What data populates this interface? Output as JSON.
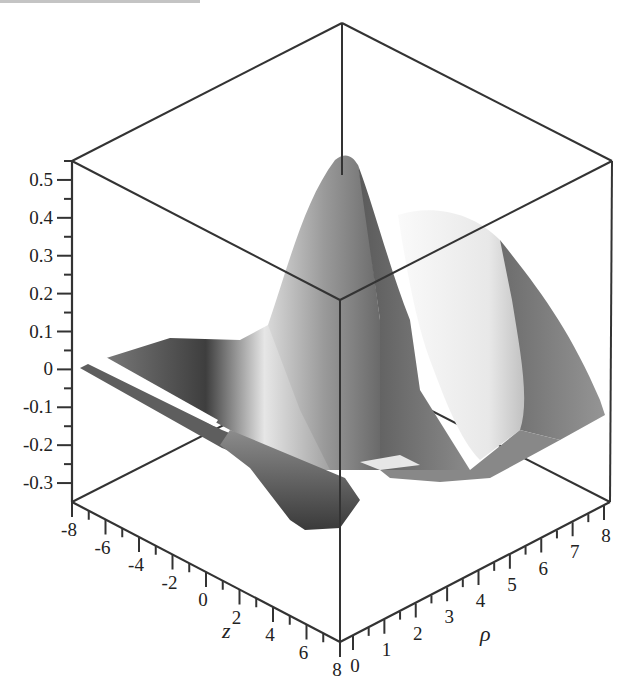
{
  "header": {
    "cropped_text": ""
  },
  "chart_data": {
    "type": "surface3d",
    "title": "",
    "xlabel": "z",
    "ylabel": "ρ",
    "zlabel": "",
    "x_range": [
      -8,
      8
    ],
    "y_range": [
      0,
      8
    ],
    "z_range": [
      -0.35,
      0.55
    ],
    "x_ticks": [
      -8,
      -6,
      -4,
      -2,
      0,
      2,
      4,
      6,
      8
    ],
    "x_tick_labels": [
      "-8",
      "-6",
      "-4",
      "-2",
      "0",
      "2",
      "4",
      "6",
      "8"
    ],
    "y_ticks": [
      0,
      1,
      2,
      3,
      4,
      5,
      6,
      7,
      8
    ],
    "y_tick_labels": [
      "0",
      "1",
      "2",
      "3",
      "4",
      "5",
      "6",
      "7",
      "8"
    ],
    "z_ticks": [
      -0.3,
      -0.2,
      -0.1,
      0,
      0.1,
      0.2,
      0.3,
      0.4,
      0.5
    ],
    "z_tick_labels": [
      "-0.3",
      "-0.2",
      "-0.1",
      "0",
      "0.1",
      "0.2",
      "0.3",
      "0.4",
      "0.5"
    ],
    "surface_description": "Grayscale shaded surface with a central peak near z=0, ρ≈0 reaching about 0.55, oscillating ridges and troughs radiating outward, minimum about -0.3",
    "grid": false,
    "legend": "none",
    "colormap": "grayscale"
  }
}
